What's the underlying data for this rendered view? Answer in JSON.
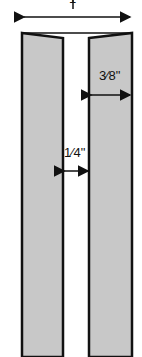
{
  "diagram": {
    "top_label": "1",
    "right_width_label": "3⁄8\"",
    "gap_label": "1⁄4\"",
    "colors": {
      "fill": "#c8c8c8",
      "stroke": "#111111",
      "background": "#ffffff"
    }
  }
}
